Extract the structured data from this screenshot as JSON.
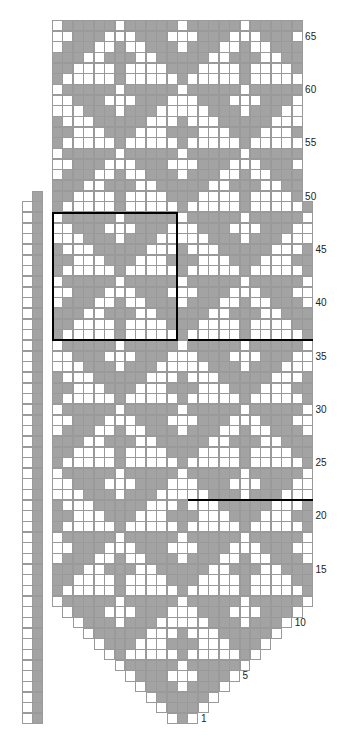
{
  "chart_data": {
    "type": "knitting-chart",
    "title": "",
    "total_rows": 66,
    "row_labels": [
      "1",
      "5",
      "10",
      "15",
      "20",
      "25",
      "30",
      "35",
      "40",
      "45",
      "50",
      "55",
      "60",
      "65"
    ],
    "colors": {
      "contrast": "#a3a3a3",
      "background": "#ffffff",
      "grid": "#9a9a9a",
      "outline": "#000000"
    },
    "repeat_width": 12,
    "repeat_height": 12,
    "repeat_rows_top_to_bottom": [
      "WGGGGGWGGGGG",
      "WWGGGWWWGGGW",
      "WGGGWWGWWGGG",
      "GGGWWGGGWWGG",
      "GGWWWWGWWWWG",
      "GWWWWWGWWWWW",
      "WGGGGGWGGGGG",
      "WWGGGWWWGGGW",
      "WWWGGGWGGGWW",
      "GWWWGGGGGWWW",
      "GGWWWGGGWWWG",
      "GWWWWWGWWWWW"
    ],
    "shape": {
      "taper_rows": "rows 1-12 widen from 3 stitches to 25 stitches",
      "body_stitches_rows_13_49": 25,
      "top_stitches_rows_50_66": 24
    },
    "side_strip": {
      "columns": [
        "white",
        "gray"
      ],
      "rows": "1-49"
    },
    "highlight_box": {
      "rows": "37-48",
      "stitches": "1-12"
    },
    "marker_lines": [
      {
        "after_row": 36
      },
      {
        "after_row": 21
      }
    ]
  }
}
